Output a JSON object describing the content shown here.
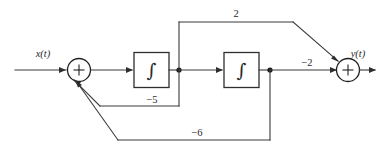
{
  "diagram": {
    "kind": "signal-flow-block-diagram",
    "background_color": "#ffffff",
    "line_color": "#3a3a3a",
    "input": {
      "label": "x(t)"
    },
    "output": {
      "label": "y(t)"
    },
    "blocks": [
      {
        "id": "integrator-1",
        "glyph": "∫",
        "glyph_name": "integral-sign"
      },
      {
        "id": "integrator-2",
        "glyph": "∫",
        "glyph_name": "integral-sign"
      }
    ],
    "summers": [
      {
        "id": "summer-input",
        "sign": "+"
      },
      {
        "id": "summer-output",
        "sign": "+"
      }
    ],
    "gains": [
      {
        "id": "gain-feedforward-top",
        "label": "2"
      },
      {
        "id": "gain-output",
        "label": "−2"
      },
      {
        "id": "gain-feedback-inner",
        "label": "−5"
      },
      {
        "id": "gain-feedback-outer",
        "label": "−6"
      }
    ]
  }
}
